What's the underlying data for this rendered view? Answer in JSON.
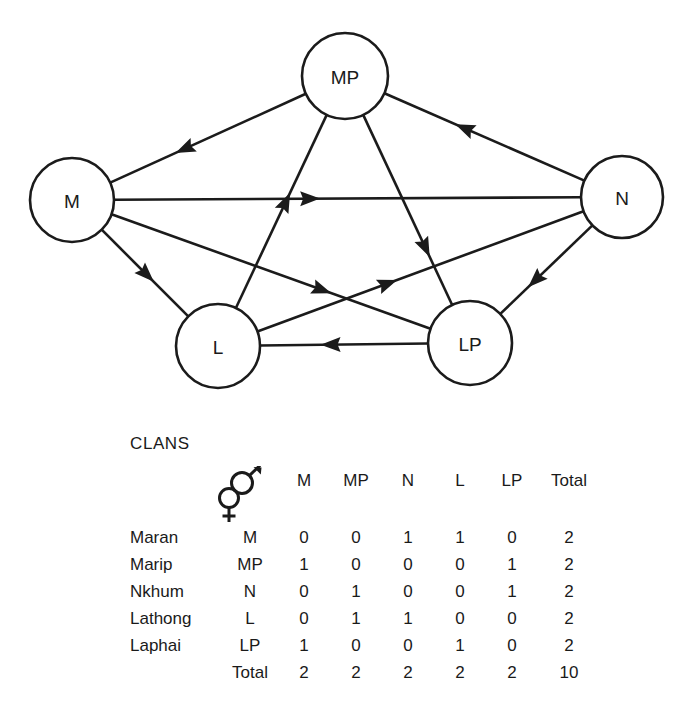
{
  "figure": {
    "diagram": {
      "title": "clan marriage network",
      "nodes": [
        {
          "id": "M",
          "label": "M",
          "cx": 72,
          "cy": 200,
          "r": 42
        },
        {
          "id": "MP",
          "label": "MP",
          "cx": 345,
          "cy": 76,
          "r": 43
        },
        {
          "id": "N",
          "label": "N",
          "cx": 622,
          "cy": 197,
          "r": 41
        },
        {
          "id": "L",
          "label": "L",
          "cx": 218,
          "cy": 346,
          "r": 42
        },
        {
          "id": "LP",
          "label": "LP",
          "cx": 470,
          "cy": 343,
          "r": 42
        }
      ],
      "edges": [
        {
          "from": "MP",
          "to": "M",
          "arrow_t": 0.62
        },
        {
          "from": "MP",
          "to": "LP",
          "arrow_t": 0.7
        },
        {
          "from": "M",
          "to": "N",
          "arrow_t": 0.42
        },
        {
          "from": "M",
          "to": "L",
          "arrow_t": 0.52
        },
        {
          "from": "M",
          "to": "LP",
          "arrow_t": 0.66
        },
        {
          "from": "N",
          "to": "MP",
          "arrow_t": 0.6
        },
        {
          "from": "N",
          "to": "LP",
          "arrow_t": 0.62
        },
        {
          "from": "L",
          "to": "MP",
          "arrow_t": 0.55
        },
        {
          "from": "L",
          "to": "N",
          "arrow_t": 0.4
        },
        {
          "from": "LP",
          "to": "L",
          "arrow_t": 0.58
        }
      ]
    },
    "table": {
      "caption": "CLANS",
      "male_symbol": "male-symbol",
      "female_symbol": "female-symbol",
      "column_headers": [
        "M",
        "MP",
        "N",
        "L",
        "LP",
        "Total"
      ],
      "rows": [
        {
          "name": "Maran",
          "code": "M",
          "values": [
            "0",
            "0",
            "1",
            "1",
            "0"
          ],
          "total": "2"
        },
        {
          "name": "Marip",
          "code": "MP",
          "values": [
            "1",
            "0",
            "0",
            "0",
            "1"
          ],
          "total": "2"
        },
        {
          "name": "Nkhum",
          "code": "N",
          "values": [
            "0",
            "1",
            "0",
            "0",
            "1"
          ],
          "total": "2"
        },
        {
          "name": "Lathong",
          "code": "L",
          "values": [
            "0",
            "1",
            "1",
            "0",
            "0"
          ],
          "total": "2"
        },
        {
          "name": "Laphai",
          "code": "LP",
          "values": [
            "1",
            "0",
            "0",
            "1",
            "0"
          ],
          "total": "2"
        }
      ],
      "totals_row": {
        "label": "Total",
        "values": [
          "2",
          "2",
          "2",
          "2",
          "2"
        ],
        "total": "10"
      }
    },
    "colors": {
      "ink": "#1b1b1b",
      "background": "#ffffff"
    }
  },
  "chart_data": {
    "type": "table",
    "title": "CLANS",
    "categories": [
      "M",
      "MP",
      "N",
      "L",
      "LP"
    ],
    "row_labels": [
      "Maran",
      "Marip",
      "Nkhum",
      "Lathong",
      "Laphai"
    ],
    "row_codes": [
      "M",
      "MP",
      "N",
      "L",
      "LP"
    ],
    "matrix": [
      [
        0,
        0,
        1,
        1,
        0
      ],
      [
        1,
        0,
        0,
        0,
        1
      ],
      [
        0,
        1,
        0,
        0,
        1
      ],
      [
        0,
        1,
        1,
        0,
        0
      ],
      [
        1,
        0,
        0,
        1,
        0
      ]
    ],
    "row_totals": [
      2,
      2,
      2,
      2,
      2
    ],
    "column_totals": [
      2,
      2,
      2,
      2
    ],
    "grand_total": 10,
    "xlabel": "male-symbol",
    "ylabel": "female-symbol",
    "directed_edges": [
      [
        "M",
        "N"
      ],
      [
        "M",
        "L"
      ],
      [
        "MP",
        "M"
      ],
      [
        "MP",
        "LP"
      ],
      [
        "N",
        "MP"
      ],
      [
        "N",
        "LP"
      ],
      [
        "L",
        "MP"
      ],
      [
        "L",
        "N"
      ],
      [
        "LP",
        "M"
      ],
      [
        "LP",
        "L"
      ]
    ],
    "grid": false,
    "legend": "none"
  }
}
